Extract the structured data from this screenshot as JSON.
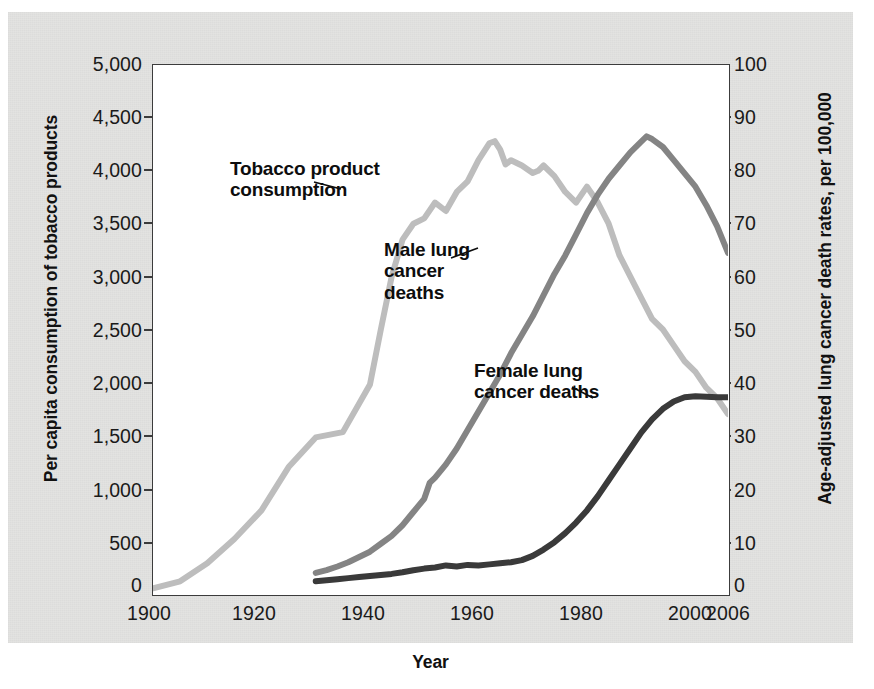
{
  "figure": {
    "background_color": "#e3e3e1",
    "plot_background": "#ffffff",
    "axis_color": "#3c3c3c"
  },
  "chart_data": {
    "type": "line",
    "title": "",
    "xlabel": "Year",
    "ylabel": "Per capita consumption of tobacco products",
    "ylabel_right": "Age-adjusted lung cancer death rates, per 100,000",
    "grid": false,
    "legend": "annotations-on-plot",
    "xlim": [
      1900,
      2006
    ],
    "xticks": [
      1900,
      1920,
      1940,
      1960,
      1980,
      2000,
      2006
    ],
    "xticklabels": [
      "1900",
      "1920",
      "1940",
      "1960",
      "1980",
      "2000",
      "2006"
    ],
    "ylim_left": [
      0,
      5000
    ],
    "yticks_left": [
      0,
      500,
      1000,
      1500,
      2000,
      2500,
      3000,
      3500,
      4000,
      4500,
      5000
    ],
    "yticklabels_left": [
      "0",
      "500",
      "1,000",
      "1,500",
      "2,000",
      "2,500",
      "3,000",
      "3,500",
      "4,000",
      "4,500",
      "5,000"
    ],
    "ylim_right": [
      0,
      100
    ],
    "yticks_right": [
      0,
      10,
      20,
      30,
      40,
      50,
      60,
      70,
      80,
      90,
      100
    ],
    "yticklabels_right": [
      "0",
      "10",
      "20",
      "30",
      "40",
      "50",
      "60",
      "70",
      "80",
      "90",
      "100"
    ],
    "series": [
      {
        "name": "Tobacco product consumption",
        "axis": "left",
        "color": "#bdbdbd",
        "label_text": "Tobacco product\nconsumption",
        "x": [
          1900,
          1905,
          1910,
          1915,
          1920,
          1925,
          1930,
          1935,
          1940,
          1942,
          1944,
          1946,
          1948,
          1950,
          1952,
          1954,
          1956,
          1958,
          1960,
          1962,
          1963,
          1964,
          1965,
          1966,
          1968,
          1970,
          1971,
          1972,
          1974,
          1976,
          1978,
          1980,
          1982,
          1984,
          1986,
          1988,
          1990,
          1992,
          1994,
          1996,
          1998,
          2000,
          2002,
          2004,
          2006
        ],
        "y": [
          54,
          120,
          290,
          520,
          790,
          1200,
          1480,
          1530,
          1980,
          2500,
          3000,
          3350,
          3500,
          3550,
          3700,
          3620,
          3800,
          3900,
          4100,
          4260,
          4280,
          4200,
          4060,
          4100,
          4050,
          3980,
          4000,
          4050,
          3950,
          3800,
          3700,
          3850,
          3700,
          3500,
          3200,
          3000,
          2800,
          2600,
          2500,
          2350,
          2200,
          2100,
          1950,
          1850,
          1700
        ]
      },
      {
        "name": "Male lung cancer deaths",
        "axis": "right",
        "color": "#848484",
        "label_text": "Male lung\ncancer\ndeaths",
        "x": [
          1930,
          1932,
          1934,
          1936,
          1938,
          1940,
          1942,
          1944,
          1946,
          1948,
          1950,
          1951,
          1952,
          1954,
          1956,
          1958,
          1960,
          1962,
          1964,
          1966,
          1968,
          1970,
          1972,
          1974,
          1976,
          1978,
          1980,
          1982,
          1984,
          1986,
          1988,
          1990,
          1991,
          1992,
          1994,
          1996,
          1998,
          2000,
          2002,
          2004,
          2006
        ],
        "y": [
          4.0,
          4.5,
          5.2,
          6.0,
          7.0,
          8.0,
          9.5,
          11.0,
          13.0,
          15.5,
          18.0,
          21.0,
          22.0,
          24.5,
          27.5,
          31.0,
          34.5,
          38.0,
          41.5,
          45.5,
          49.0,
          52.5,
          56.5,
          60.5,
          64.0,
          68.0,
          72.0,
          75.5,
          78.5,
          81.0,
          83.5,
          85.5,
          86.5,
          86.0,
          84.5,
          82.0,
          79.5,
          77.0,
          73.5,
          69.5,
          64.5
        ]
      },
      {
        "name": "Female lung cancer deaths",
        "axis": "right",
        "color": "#3a3a3a",
        "label_text": "Female lung\ncancer deaths",
        "x": [
          1930,
          1932,
          1934,
          1936,
          1938,
          1940,
          1942,
          1944,
          1946,
          1948,
          1950,
          1952,
          1954,
          1956,
          1958,
          1960,
          1962,
          1964,
          1966,
          1968,
          1970,
          1972,
          1974,
          1976,
          1978,
          1980,
          1982,
          1984,
          1986,
          1988,
          1990,
          1992,
          1994,
          1996,
          1998,
          2000,
          2002,
          2004,
          2006
        ],
        "y": [
          2.4,
          2.6,
          2.8,
          3.0,
          3.2,
          3.4,
          3.6,
          3.8,
          4.1,
          4.5,
          4.8,
          5.0,
          5.4,
          5.2,
          5.5,
          5.4,
          5.6,
          5.8,
          6.0,
          6.4,
          7.2,
          8.4,
          9.8,
          11.5,
          13.5,
          15.8,
          18.5,
          21.5,
          24.5,
          27.5,
          30.5,
          33.0,
          35.0,
          36.4,
          37.2,
          37.4,
          37.3,
          37.2,
          37.2
        ]
      }
    ],
    "annotations": [
      {
        "name": "tobacco-annotation",
        "text": "Tobacco product\nconsumption"
      },
      {
        "name": "male-annotation",
        "text": "Male lung\ncancer\ndeaths"
      },
      {
        "name": "female-annotation",
        "text": "Female lung\ncancer deaths"
      }
    ]
  }
}
